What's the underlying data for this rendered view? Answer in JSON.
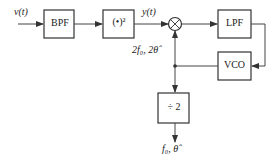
{
  "diagram": {
    "input_label": "v(t)",
    "blocks": {
      "bpf": "BPF",
      "square": "(•)²",
      "lpf": "LPF",
      "vco": "VCO",
      "divider": "÷ 2"
    },
    "signal_y": "y(t)",
    "vco_output_label": "2f₀, 2θ̂",
    "output_label": "f₀, θ̂",
    "mixer_symbol": "⊗"
  }
}
